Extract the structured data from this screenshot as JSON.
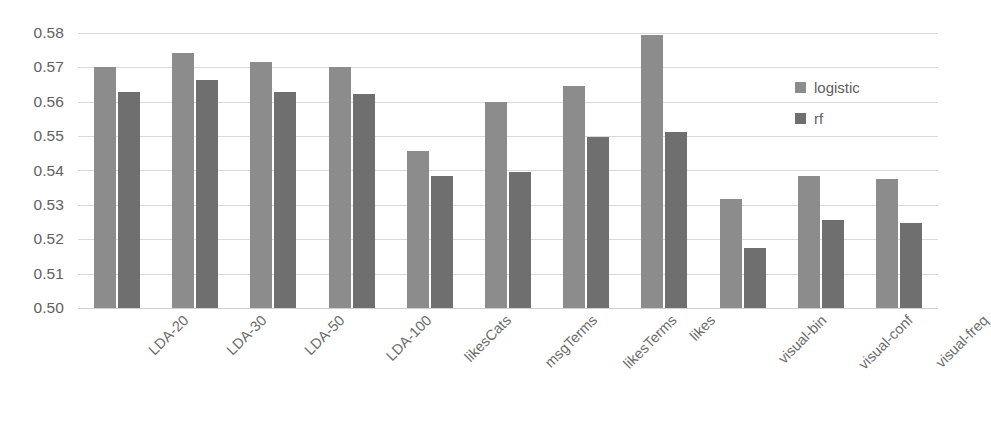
{
  "chart_data": {
    "type": "bar",
    "title": "",
    "subtitle": "",
    "xlabel": "",
    "ylabel": "",
    "ylim": [
      0.5,
      0.58
    ],
    "ytick_step": 0.01,
    "ytick_labels": [
      "0.58",
      "0.57",
      "0.56",
      "0.55",
      "0.54",
      "0.53",
      "0.52",
      "0.51",
      "0.50"
    ],
    "ytick_values": [
      0.58,
      0.57,
      0.56,
      0.55,
      0.54,
      0.53,
      0.52,
      0.51,
      0.5
    ],
    "grid": true,
    "grid_axis": "y",
    "legend_position": "inside-top-right",
    "xtick_rotation": -45,
    "categories": [
      "LDA-20",
      "LDA-30",
      "LDA-50",
      "LDA-100",
      "likesCats",
      "msgTerms",
      "likesTerms",
      "likes",
      "visual-bin",
      "visual-conf",
      "visual-freq"
    ],
    "series": [
      {
        "name": "logistic",
        "color": "#8c8c8c",
        "values": [
          0.57,
          0.5743,
          0.5715,
          0.57,
          0.5456,
          0.5598,
          0.5645,
          0.5795,
          0.5316,
          0.5385,
          0.5376
        ]
      },
      {
        "name": "rf",
        "color": "#6f6f6f",
        "values": [
          0.5627,
          0.5662,
          0.5628,
          0.5622,
          0.5383,
          0.5395,
          0.5497,
          0.5513,
          0.5174,
          0.5256,
          0.5247
        ]
      }
    ]
  },
  "legend": {
    "entries": [
      {
        "label": "logistic",
        "color": "#8c8c8c"
      },
      {
        "label": "rf",
        "color": "#6f6f6f"
      }
    ]
  },
  "colors": {
    "background": "#ffffff",
    "gridline": "#d9d9d9",
    "tick_text": "#616161",
    "label_text": "#6b6b6b",
    "series_logistic": "#8c8c8c",
    "series_rf": "#6f6f6f"
  }
}
